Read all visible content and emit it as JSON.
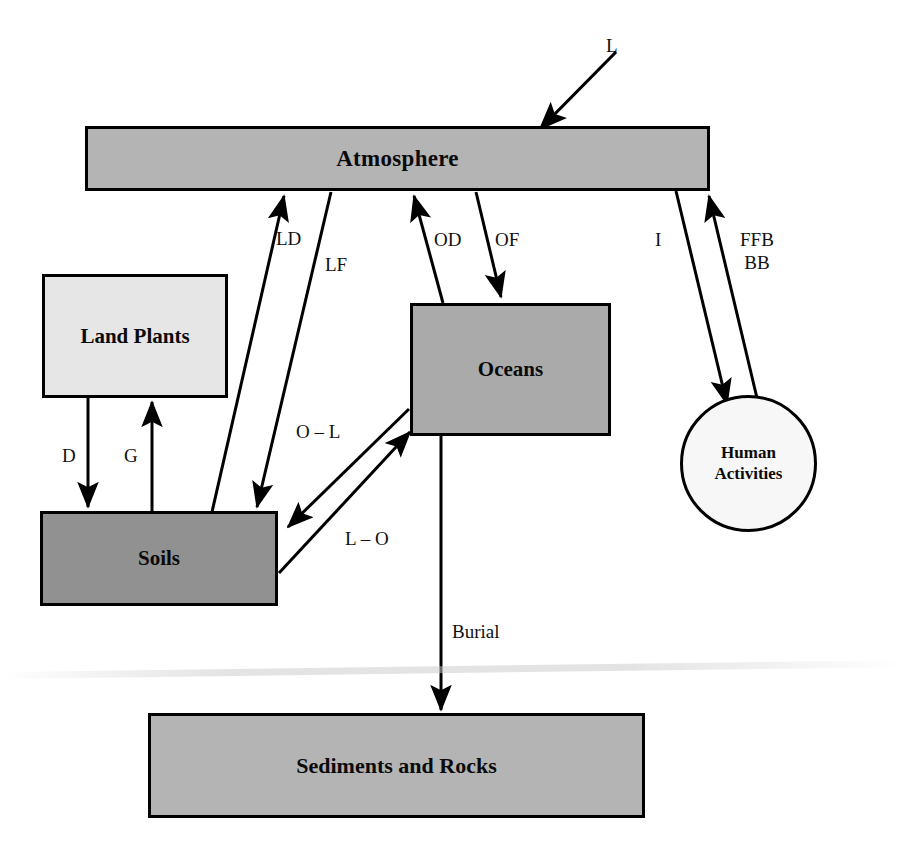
{
  "diagram": {
    "background_color": "#ffffff",
    "stroke_color": "#000000"
  },
  "nodes": [
    {
      "id": "atmosphere",
      "label": "Atmosphere",
      "shape": "rectangle",
      "fill": "#b4b4b4"
    },
    {
      "id": "land_plants",
      "label": "Land Plants",
      "shape": "rectangle",
      "fill": "#e6e6e6"
    },
    {
      "id": "soils",
      "label": "Soils",
      "shape": "rectangle",
      "fill": "#919191"
    },
    {
      "id": "oceans",
      "label": "Oceans",
      "shape": "rectangle",
      "fill": "#aaaaaa"
    },
    {
      "id": "sediments",
      "label": "Sediments and Rocks",
      "shape": "rectangle",
      "fill": "#b4b4b4"
    },
    {
      "id": "human_activities",
      "label": "Human\nActivities",
      "shape": "circle",
      "fill": "#f7f7f7"
    }
  ],
  "flux_labels": {
    "l": "L",
    "ld": "LD",
    "lf": "LF",
    "od": "OD",
    "of": "OF",
    "i": "I",
    "ffb_bb": "FFB\nBB",
    "d": "D",
    "g": "G",
    "o_l": "O – L",
    "l_o": "L – O",
    "burial": "Burial"
  },
  "edges": [
    {
      "id": "l",
      "label": "L",
      "from": "external",
      "to": "atmosphere",
      "direction": "into-atmosphere"
    },
    {
      "id": "ld",
      "label": "LD",
      "from": "soils",
      "to": "atmosphere",
      "direction": "up"
    },
    {
      "id": "lf",
      "label": "LF",
      "from": "atmosphere",
      "to": "soils",
      "direction": "down"
    },
    {
      "id": "od",
      "label": "OD",
      "from": "oceans",
      "to": "atmosphere",
      "direction": "up"
    },
    {
      "id": "of",
      "label": "OF",
      "from": "atmosphere",
      "to": "oceans",
      "direction": "down"
    },
    {
      "id": "i",
      "label": "I",
      "from": "atmosphere",
      "to": "human_activities",
      "direction": "down"
    },
    {
      "id": "ffb_bb",
      "label": "FFB BB",
      "from": "human_activities",
      "to": "atmosphere",
      "direction": "up"
    },
    {
      "id": "d",
      "label": "D",
      "from": "land_plants",
      "to": "soils",
      "direction": "down"
    },
    {
      "id": "g",
      "label": "G",
      "from": "soils",
      "to": "land_plants",
      "direction": "up"
    },
    {
      "id": "o_l",
      "label": "O – L",
      "from": "oceans",
      "to": "soils",
      "direction": "down-left"
    },
    {
      "id": "l_o",
      "label": "L – O",
      "from": "soils",
      "to": "oceans",
      "direction": "up-right"
    },
    {
      "id": "burial",
      "label": "Burial",
      "from": "oceans",
      "to": "sediments",
      "direction": "down"
    }
  ]
}
